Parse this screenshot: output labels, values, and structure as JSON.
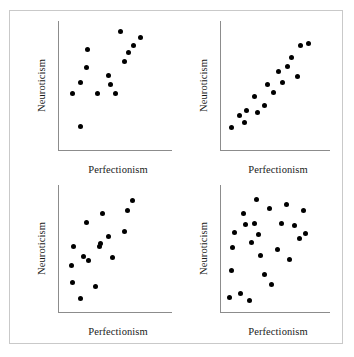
{
  "figure": {
    "frame_color": "#c9c9c9",
    "axis_color": "#8c8c8c",
    "dot_color": "#000000",
    "background": "#ffffff"
  },
  "chart_data": [
    {
      "type": "scatter",
      "panel": "top-left",
      "title": "",
      "xlabel": "Perfectionism",
      "ylabel": "Neuroticism",
      "xlim": [
        0,
        100
      ],
      "ylim": [
        0,
        100
      ],
      "grid": false,
      "legend": "none",
      "annotation": "moderate positive correlation",
      "n_points": 14,
      "points": [
        {
          "x": 13,
          "y": 44
        },
        {
          "x": 20,
          "y": 53
        },
        {
          "x": 20,
          "y": 19
        },
        {
          "x": 25,
          "y": 64
        },
        {
          "x": 26,
          "y": 78
        },
        {
          "x": 35,
          "y": 44
        },
        {
          "x": 44,
          "y": 58
        },
        {
          "x": 46,
          "y": 51
        },
        {
          "x": 50,
          "y": 44
        },
        {
          "x": 55,
          "y": 92
        },
        {
          "x": 58,
          "y": 69
        },
        {
          "x": 62,
          "y": 76
        },
        {
          "x": 66,
          "y": 81
        },
        {
          "x": 72,
          "y": 87
        }
      ]
    },
    {
      "type": "scatter",
      "panel": "top-right",
      "title": "",
      "xlabel": "Perfectionism",
      "ylabel": "Neuroticism",
      "xlim": [
        0,
        100
      ],
      "ylim": [
        0,
        100
      ],
      "grid": false,
      "legend": "none",
      "annotation": "strong positive linear correlation",
      "n_points": 16,
      "points": [
        {
          "x": 10,
          "y": 18
        },
        {
          "x": 18,
          "y": 27
        },
        {
          "x": 22,
          "y": 22
        },
        {
          "x": 24,
          "y": 31
        },
        {
          "x": 31,
          "y": 42
        },
        {
          "x": 34,
          "y": 30
        },
        {
          "x": 40,
          "y": 35
        },
        {
          "x": 43,
          "y": 51
        },
        {
          "x": 49,
          "y": 45
        },
        {
          "x": 53,
          "y": 61
        },
        {
          "x": 57,
          "y": 53
        },
        {
          "x": 61,
          "y": 65
        },
        {
          "x": 65,
          "y": 72
        },
        {
          "x": 70,
          "y": 57
        },
        {
          "x": 73,
          "y": 81
        },
        {
          "x": 80,
          "y": 83
        }
      ]
    },
    {
      "type": "scatter",
      "panel": "bottom-left",
      "title": "",
      "xlabel": "Perfectionism",
      "ylabel": "Neuroticism",
      "xlim": [
        0,
        100
      ],
      "ylim": [
        0,
        100
      ],
      "grid": false,
      "legend": "none",
      "annotation": "weak positive correlation",
      "n_points": 16,
      "points": [
        {
          "x": 12,
          "y": 37
        },
        {
          "x": 13,
          "y": 24
        },
        {
          "x": 14,
          "y": 52
        },
        {
          "x": 20,
          "y": 11
        },
        {
          "x": 22,
          "y": 44
        },
        {
          "x": 25,
          "y": 71
        },
        {
          "x": 27,
          "y": 41
        },
        {
          "x": 33,
          "y": 21
        },
        {
          "x": 36,
          "y": 52
        },
        {
          "x": 37,
          "y": 54
        },
        {
          "x": 39,
          "y": 78
        },
        {
          "x": 44,
          "y": 60
        },
        {
          "x": 48,
          "y": 43
        },
        {
          "x": 58,
          "y": 64
        },
        {
          "x": 61,
          "y": 80
        },
        {
          "x": 65,
          "y": 88
        }
      ]
    },
    {
      "type": "scatter",
      "panel": "bottom-right",
      "title": "",
      "xlabel": "Perfectionism",
      "ylabel": "Neuroticism",
      "xlim": [
        0,
        100
      ],
      "ylim": [
        0,
        100
      ],
      "grid": false,
      "legend": "none",
      "annotation": "no correlation, random scatter",
      "n_points": 22,
      "points": [
        {
          "x": 9,
          "y": 12
        },
        {
          "x": 10,
          "y": 33
        },
        {
          "x": 11,
          "y": 51
        },
        {
          "x": 13,
          "y": 63
        },
        {
          "x": 19,
          "y": 15
        },
        {
          "x": 21,
          "y": 78
        },
        {
          "x": 23,
          "y": 69
        },
        {
          "x": 27,
          "y": 10
        },
        {
          "x": 29,
          "y": 55
        },
        {
          "x": 31,
          "y": 70
        },
        {
          "x": 33,
          "y": 89
        },
        {
          "x": 35,
          "y": 61
        },
        {
          "x": 37,
          "y": 45
        },
        {
          "x": 40,
          "y": 30
        },
        {
          "x": 45,
          "y": 82
        },
        {
          "x": 47,
          "y": 22
        },
        {
          "x": 52,
          "y": 50
        },
        {
          "x": 56,
          "y": 70
        },
        {
          "x": 60,
          "y": 85
        },
        {
          "x": 63,
          "y": 42
        },
        {
          "x": 68,
          "y": 68
        },
        {
          "x": 72,
          "y": 58
        },
        {
          "x": 76,
          "y": 80
        },
        {
          "x": 78,
          "y": 62
        }
      ]
    }
  ]
}
